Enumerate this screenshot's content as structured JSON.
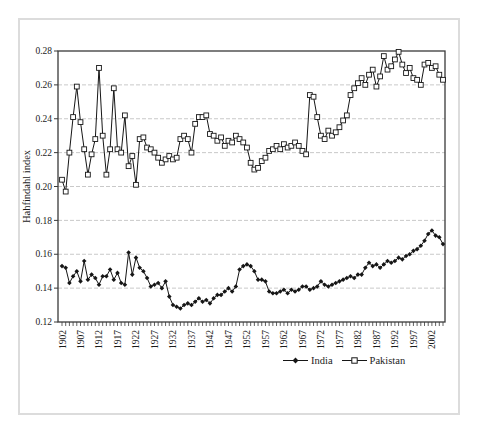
{
  "figure": {
    "background": "#ffffff",
    "outer_border_color": "#dcdcdc"
  },
  "chart_data": {
    "type": "line",
    "title": "",
    "xlabel": "",
    "ylabel": "Hahfindahl index",
    "x_years_range": [
      1902,
      2005
    ],
    "ylim": [
      0.12,
      0.28
    ],
    "y_tick_step": 0.02,
    "y_tick_labels": [
      "0.12",
      "0.14",
      "0.16",
      "0.18",
      "0.20",
      "0.22",
      "0.24",
      "0.26",
      "0.28"
    ],
    "x_tick_labels": [
      "1902",
      "1907",
      "1912",
      "1917",
      "1922",
      "1927",
      "1932",
      "1937",
      "1942",
      "1947",
      "1952",
      "1957",
      "1962",
      "1967",
      "1972",
      "1977",
      "1982",
      "1987",
      "1992",
      "1997",
      "2002"
    ],
    "x_tick_interval_years": 5,
    "grid": "horizontal-dashed",
    "legend_position": "bottom-center",
    "colors": {
      "line": "#161616",
      "grid": "#c9c9c9",
      "axis": "#3a3a3a",
      "text": "#1c1c1c",
      "marker_fill_pakistan": "#ffffff"
    },
    "series": [
      {
        "name": "India",
        "marker": "filled-diamond",
        "values": [
          0.153,
          0.152,
          0.143,
          0.147,
          0.15,
          0.144,
          0.156,
          0.145,
          0.148,
          0.146,
          0.142,
          0.147,
          0.147,
          0.151,
          0.145,
          0.149,
          0.143,
          0.142,
          0.161,
          0.148,
          0.158,
          0.152,
          0.15,
          0.146,
          0.141,
          0.142,
          0.143,
          0.14,
          0.144,
          0.135,
          0.13,
          0.129,
          0.128,
          0.13,
          0.131,
          0.13,
          0.132,
          0.134,
          0.132,
          0.133,
          0.131,
          0.134,
          0.136,
          0.136,
          0.138,
          0.14,
          0.138,
          0.141,
          0.151,
          0.153,
          0.154,
          0.153,
          0.15,
          0.145,
          0.145,
          0.144,
          0.138,
          0.137,
          0.137,
          0.138,
          0.139,
          0.137,
          0.139,
          0.138,
          0.139,
          0.141,
          0.141,
          0.139,
          0.14,
          0.141,
          0.144,
          0.142,
          0.141,
          0.142,
          0.143,
          0.144,
          0.145,
          0.146,
          0.147,
          0.146,
          0.148,
          0.148,
          0.152,
          0.155,
          0.153,
          0.154,
          0.152,
          0.154,
          0.156,
          0.155,
          0.156,
          0.158,
          0.157,
          0.159,
          0.16,
          0.162,
          0.163,
          0.165,
          0.168,
          0.172,
          0.174,
          0.171,
          0.17,
          0.166
        ]
      },
      {
        "name": "Pakistan",
        "marker": "open-square",
        "values": [
          0.204,
          0.197,
          0.22,
          0.241,
          0.259,
          0.238,
          0.222,
          0.207,
          0.219,
          0.228,
          0.27,
          0.23,
          0.207,
          0.222,
          0.258,
          0.222,
          0.22,
          0.242,
          0.212,
          0.218,
          0.201,
          0.228,
          0.229,
          0.223,
          0.222,
          0.22,
          0.217,
          0.214,
          0.216,
          0.218,
          0.216,
          0.217,
          0.228,
          0.23,
          0.228,
          0.22,
          0.237,
          0.241,
          0.241,
          0.242,
          0.231,
          0.23,
          0.227,
          0.229,
          0.224,
          0.227,
          0.226,
          0.23,
          0.228,
          0.226,
          0.223,
          0.214,
          0.21,
          0.211,
          0.215,
          0.217,
          0.221,
          0.222,
          0.224,
          0.222,
          0.225,
          0.223,
          0.224,
          0.226,
          0.224,
          0.221,
          0.219,
          0.254,
          0.253,
          0.241,
          0.23,
          0.228,
          0.233,
          0.23,
          0.232,
          0.235,
          0.239,
          0.242,
          0.254,
          0.258,
          0.261,
          0.264,
          0.26,
          0.266,
          0.269,
          0.259,
          0.265,
          0.277,
          0.269,
          0.271,
          0.275,
          0.2795,
          0.272,
          0.267,
          0.27,
          0.264,
          0.263,
          0.26,
          0.272,
          0.273,
          0.27,
          0.271,
          0.266,
          0.263
        ]
      }
    ]
  }
}
